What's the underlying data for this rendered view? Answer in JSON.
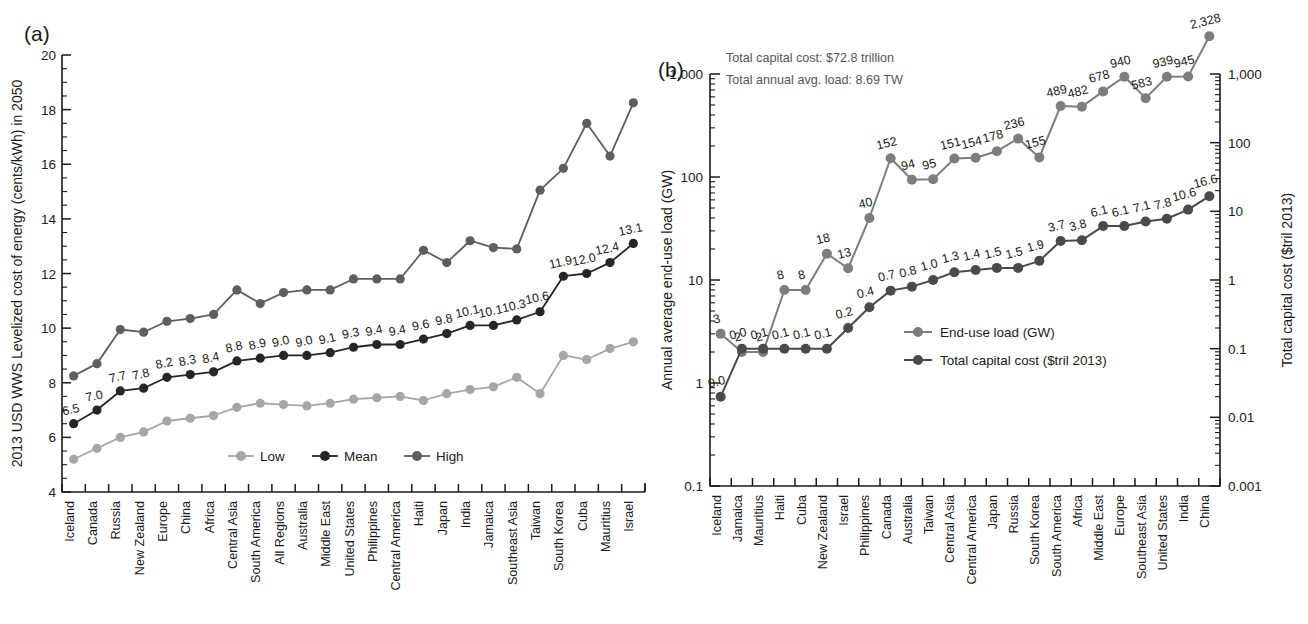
{
  "figure": {
    "panel_a_tag": "(a)",
    "panel_b_tag": "(b)"
  },
  "chart_data": [
    {
      "id": "panel_a",
      "type": "line",
      "title": "",
      "xlabel": "",
      "ylabel": "2013 USD WWS Levelized cost of energy (cents/kWh) in 2050",
      "ylim": [
        4,
        20
      ],
      "ytick_labels": [
        "4",
        "6",
        "8",
        "10",
        "12",
        "14",
        "16",
        "18",
        "20"
      ],
      "ytick_values": [
        4,
        6,
        8,
        10,
        12,
        14,
        16,
        18,
        20
      ],
      "yscale": "linear",
      "grid": false,
      "legend_position": "bottom-center",
      "categories": [
        "Iceland",
        "Canada",
        "Russia",
        "New Zealand",
        "Europe",
        "China",
        "Africa",
        "Central Asia",
        "South America",
        "All Regions",
        "Australia",
        "Middle East",
        "United States",
        "Philippines",
        "Central America",
        "Haiti",
        "Japan",
        "India",
        "Jamaica",
        "Southeast Asia",
        "Taiwan",
        "South Korea",
        "Cuba",
        "Mauritius",
        "Israel"
      ],
      "series": [
        {
          "name": "Low",
          "color": "#a6a6a6",
          "values": [
            5.2,
            5.6,
            6.0,
            6.2,
            6.6,
            6.7,
            6.8,
            7.1,
            7.25,
            7.2,
            7.15,
            7.25,
            7.4,
            7.45,
            7.5,
            7.35,
            7.6,
            7.75,
            7.85,
            8.2,
            7.6,
            9.0,
            8.85,
            9.25,
            9.5
          ]
        },
        {
          "name": "Mean",
          "color": "#262626",
          "values": [
            6.5,
            7.0,
            7.7,
            7.8,
            8.2,
            8.3,
            8.4,
            8.8,
            8.9,
            9.0,
            9.0,
            9.1,
            9.3,
            9.4,
            9.4,
            9.6,
            9.8,
            10.1,
            10.1,
            10.3,
            10.6,
            11.9,
            12.0,
            12.4,
            13.1
          ],
          "data_labels": [
            "6.5",
            "7.0",
            "7.7",
            "7.8",
            "8.2",
            "8.3",
            "8.4",
            "8.8",
            "8.9",
            "9.0",
            "9.0",
            "9.1",
            "9.3",
            "9.4",
            "9.4",
            "9.6",
            "9.8",
            "10.1",
            "10.1",
            "10.3",
            "10.6",
            "11.9",
            "12.0",
            "12.4",
            "13.1"
          ]
        },
        {
          "name": "High",
          "color": "#5e5e5e",
          "values": [
            8.25,
            8.7,
            9.95,
            9.85,
            10.25,
            10.35,
            10.5,
            11.4,
            10.9,
            11.3,
            11.4,
            11.4,
            11.8,
            11.8,
            11.8,
            12.85,
            12.4,
            13.2,
            12.95,
            12.9,
            15.05,
            15.85,
            17.5,
            16.3,
            18.25
          ]
        }
      ]
    },
    {
      "id": "panel_b",
      "type": "line",
      "title": "",
      "xlabel": "",
      "ylabel": "Annual average end-use load (GW)",
      "ylabel_right": "Total capital cost ($tril 2013)",
      "yscale": "log",
      "ylim": [
        0.1,
        1000
      ],
      "ylim_right": [
        0.001,
        1000
      ],
      "ytick_labels": [
        "0.1",
        "1",
        "10",
        "100",
        "1,000"
      ],
      "ytick_labels_right": [
        "0.001",
        "0.01",
        "0.1",
        "1",
        "10",
        "100",
        "1,000"
      ],
      "grid": false,
      "legend_position": "inside-lower-right",
      "annotations": [
        "Total capital cost: $72.8 trillion",
        "Total annual avg. load: 8.69 TW"
      ],
      "categories": [
        "Iceland",
        "Jamaica",
        "Mauritius",
        "Haiti",
        "Cuba",
        "New Zealand",
        "Israel",
        "Philippines",
        "Canada",
        "Australia",
        "Taiwan",
        "Central Asia",
        "Central America",
        "Japan",
        "Russia",
        "South Korea",
        "South America",
        "Africa",
        "Middle East",
        "Europe",
        "Southeast Asia",
        "United States",
        "India",
        "China"
      ],
      "series": [
        {
          "name": "End-use load (GW)",
          "color": "#7d7d7d",
          "values": [
            3,
            2,
            2,
            8,
            8,
            18,
            13,
            40,
            152,
            94,
            95,
            151,
            154,
            178,
            236,
            155,
            489,
            482,
            678,
            940,
            583,
            939,
            945,
            2328
          ],
          "data_labels": [
            "3",
            "2",
            "2",
            "8",
            "8",
            "18",
            "13",
            "40",
            "152",
            "94",
            "95",
            "151",
            "154",
            "178",
            "236",
            "155",
            "489",
            "482",
            "678",
            "940",
            "583",
            "939",
            "945",
            "2,328"
          ]
        },
        {
          "name": "Total capital cost ($tril 2013)",
          "color": "#4a4a4a",
          "values": [
            0.02,
            0.1,
            0.1,
            0.1,
            0.1,
            0.1,
            0.2,
            0.4,
            0.7,
            0.8,
            1.0,
            1.3,
            1.4,
            1.5,
            1.5,
            1.9,
            3.7,
            3.8,
            6.1,
            6.1,
            7.1,
            7.8,
            10.6,
            16.6
          ],
          "data_labels": [
            "0.0",
            "0.0",
            "0.1",
            "0.1",
            "0.1",
            "0.1",
            "0.2",
            "0.4",
            "0.7",
            "0.8",
            "1.0",
            "1.3",
            "1.4",
            "1.5",
            "1.5",
            "1.9",
            "3.7",
            "3.8",
            "6.1",
            "6.1",
            "7.1",
            "7.8",
            "10.6",
            "16.6"
          ]
        }
      ]
    }
  ]
}
